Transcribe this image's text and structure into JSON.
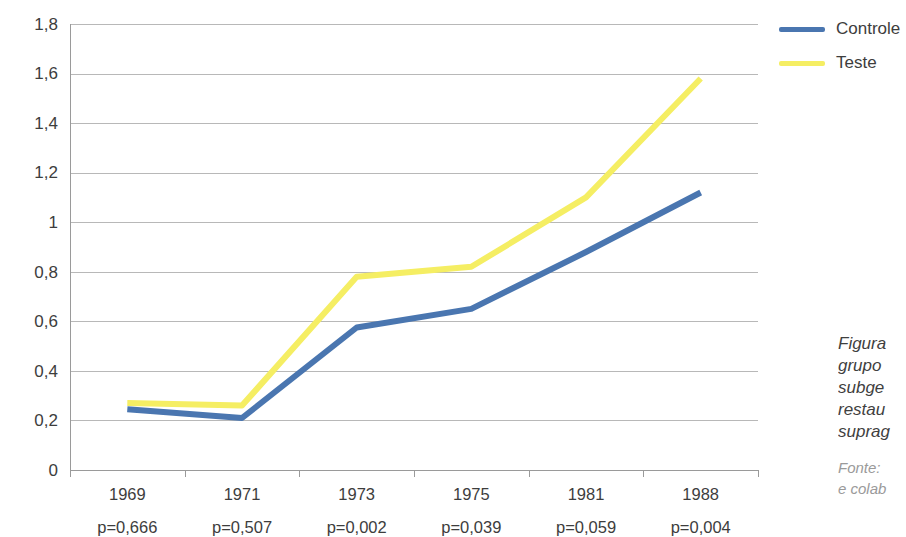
{
  "chart_data": {
    "type": "line",
    "title": "",
    "xlabel": "",
    "ylabel": "",
    "ylim": [
      0,
      1.8
    ],
    "grid": true,
    "legend_position": "top-right",
    "categories": [
      "1969",
      "1971",
      "1973",
      "1975",
      "1981",
      "1988"
    ],
    "x_sublabels": [
      "p=0,666",
      "p=0,507",
      "p=0,002",
      "p=0,039",
      "p=0,059",
      "p=0,004"
    ],
    "y_ticks": [
      0,
      0.2,
      0.4,
      0.6,
      0.8,
      1.0,
      1.2,
      1.4,
      1.6,
      1.8
    ],
    "y_tick_labels": [
      "0",
      "0,2",
      "0,4",
      "0,6",
      "0,8",
      "1",
      "1,2",
      "1,4",
      "1,6",
      "1,8"
    ],
    "series": [
      {
        "name": "Controle",
        "color": "#4A76B0",
        "values": [
          0.245,
          0.21,
          0.575,
          0.65,
          0.88,
          1.12
        ]
      },
      {
        "name": "Teste",
        "color": "#F5EE63",
        "values": [
          0.27,
          0.26,
          0.78,
          0.82,
          1.1,
          1.58
        ]
      }
    ]
  },
  "legend": {
    "items": [
      {
        "label": "Controle",
        "color": "#4A76B0"
      },
      {
        "label": "Teste",
        "color": "#F5EE63"
      }
    ]
  },
  "caption": {
    "title_lines": [
      "Figura",
      "grupo",
      "subge",
      "restau",
      "suprag"
    ],
    "source_lines": [
      "Fonte:",
      "e colab"
    ]
  },
  "colors": {
    "controle": "#4A76B0",
    "teste": "#F5EE63",
    "gridline": "#b8b8b8",
    "axis": "#9a9a9a",
    "text": "#3d3d3d",
    "muted_text": "#9a9a9a",
    "background": "#ffffff"
  }
}
